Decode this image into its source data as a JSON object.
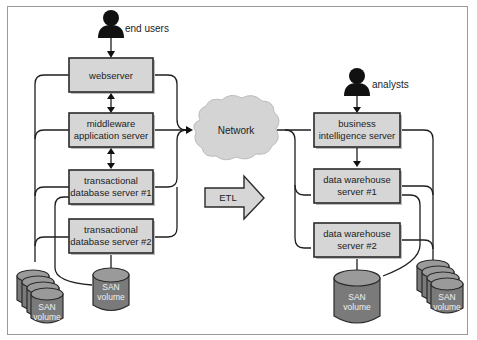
{
  "diagram": {
    "left": {
      "actor": "end users",
      "servers": [
        {
          "id": "webserver",
          "lines": [
            "webserver"
          ]
        },
        {
          "id": "middleware",
          "lines": [
            "middleware",
            "application server"
          ]
        },
        {
          "id": "txdb1",
          "lines": [
            "transactional",
            "database server #1"
          ]
        },
        {
          "id": "txdb2",
          "lines": [
            "transactional",
            "database server #2"
          ]
        }
      ],
      "storage": [
        {
          "id": "san-stack-left",
          "lines": [
            "SAN",
            "volume"
          ],
          "stacked": true
        },
        {
          "id": "san-single-left",
          "lines": [
            "SAN",
            "volume"
          ],
          "stacked": false
        }
      ]
    },
    "center": {
      "network": "Network",
      "etl": "ETL"
    },
    "right": {
      "actor": "analysts",
      "servers": [
        {
          "id": "bi",
          "lines": [
            "business",
            "intelligence server"
          ]
        },
        {
          "id": "dw1",
          "lines": [
            "data warehouse",
            "server #1"
          ]
        },
        {
          "id": "dw2",
          "lines": [
            "data warehouse",
            "server #2"
          ]
        }
      ],
      "storage": [
        {
          "id": "san-single-right",
          "lines": [
            "SAN",
            "volume"
          ],
          "stacked": false
        },
        {
          "id": "san-stack-right",
          "lines": [
            "SAN",
            "volume"
          ],
          "stacked": true
        }
      ]
    },
    "colors": {
      "box_fill": "#d6d6d6",
      "cylinder_fill": "#7a7a7a",
      "cloud_fill": "#d4d4d4",
      "line": "#1e1e1e"
    }
  }
}
